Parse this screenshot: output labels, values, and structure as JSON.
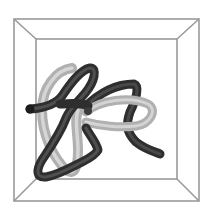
{
  "figure": {
    "colors": {
      "background": "#ffffff",
      "box_lines": "#9a9a9a",
      "dark_tube": "#2e2e2e",
      "dark_tube_highlight": "#555555",
      "light_tube": "#b4b4b4",
      "light_tube_highlight": "#d6d6d6"
    },
    "box": {
      "outer": {
        "x1": 14,
        "y1": 19,
        "x2": 199,
        "y2": 201
      },
      "inner": {
        "x1": 36,
        "y1": 39,
        "x2": 177,
        "y2": 179
      }
    }
  }
}
